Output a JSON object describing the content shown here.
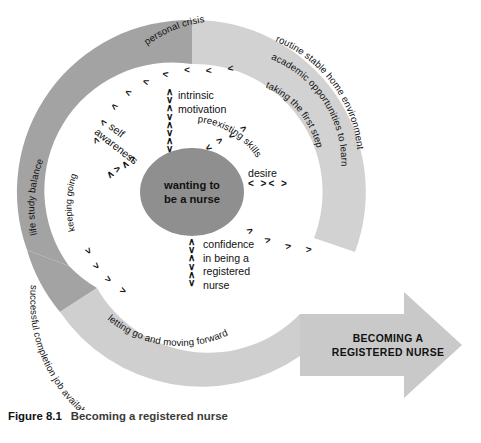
{
  "figure": {
    "number": "Figure 8.1",
    "title": "Becoming a registered nurse"
  },
  "diagram": {
    "core_label_line1": "wanting to",
    "core_label_line2": "be a nurse",
    "outer_arc_labels": {
      "top_left": "personal crisis",
      "left": "life study balance",
      "left_inner": "keeping going",
      "right_outer": "routine stable home environment",
      "right_middle": "academic opportunities to learn",
      "right_inner": "taking the first step",
      "bottom_outer": "successful completion  job availability   meeting regulatory requirements",
      "bottom_inner": "letting go and moving forward"
    },
    "inner_labels": {
      "intrinsic": "intrinsic",
      "motivation": "motivation",
      "self": "self",
      "awareness": "awareness",
      "preexisting_skills": "preexisting skills",
      "desire": "desire",
      "confidence_l1": "confidence",
      "confidence_l2": "in being a",
      "confidence_l3": "registered",
      "confidence_l4": "nurse"
    },
    "arrow_label_line1": "BECOMING A",
    "arrow_label_line2": "REGISTERED NURSE",
    "colors": {
      "ring_dark": "#a3a3a3",
      "ring_light": "#d2d2d2",
      "core_fill": "#8f8f8f",
      "arrow_fill": "#c9c9c9",
      "text": "#111111"
    },
    "chevrons": {
      "top_band": "<",
      "bottom_band": ">",
      "vertical_pair": "^ v",
      "horizontal_pair": "< >"
    }
  }
}
